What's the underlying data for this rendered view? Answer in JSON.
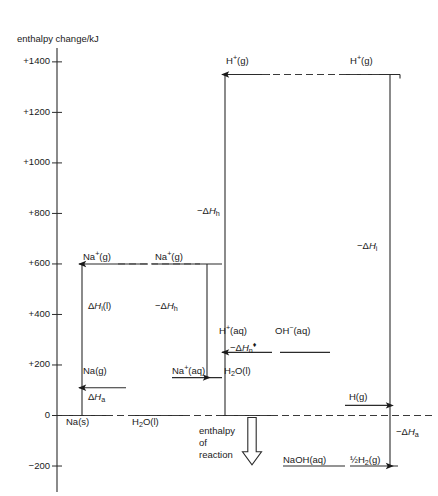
{
  "axis": {
    "title": "enthalpy change/kJ",
    "ticks": [
      "+1400",
      "+1200",
      "+1000",
      "+800",
      "+600",
      "+400",
      "+200",
      "0",
      "−200"
    ],
    "values": [
      1400,
      1200,
      1000,
      800,
      600,
      400,
      200,
      0,
      -200
    ]
  },
  "levels": {
    "na_plus_g_left": {
      "label_html": "Na<sup>+</sup>(g)",
      "value": 600
    },
    "na_plus_g_right": {
      "label_html": "Na<sup>+</sup>(g)",
      "value": 600
    },
    "na_g": {
      "label_html": "Na(g)",
      "value": 110
    },
    "na_s": {
      "label_html": "Na(s)",
      "value": 0
    },
    "h2o_l_left": {
      "label_html": "H<sub>2</sub>O(l)",
      "value": 0
    },
    "na_plus_aq": {
      "label_html": "Na<sup>+</sup>(aq)",
      "value": 150
    },
    "h_plus_g_left": {
      "label_html": "H<sup>+</sup>(g)",
      "value": 1350
    },
    "h_plus_g_right": {
      "label_html": "H<sup>+</sup>(g)",
      "value": 1350
    },
    "h_plus_aq": {
      "label_html": "H<sup>+</sup>(aq)",
      "value": 250
    },
    "oh_minus_aq": {
      "label_html": "OH<sup>−</sup>(aq)",
      "value": 250
    },
    "h2o_l_mid": {
      "label_html": "H<sub>2</sub>O(l)",
      "value": 0
    },
    "h_g": {
      "label_html": "H(g)",
      "value": 40
    },
    "naoh_aq": {
      "label_html": "NaOH(aq)",
      "value": -200
    },
    "half_h2_g": {
      "label_html": "½H<sub>2</sub>(g)",
      "value": -200
    }
  },
  "arrows": {
    "atomisation_na": {
      "label_html": "Δ<i>H</i><sub>a</sub>",
      "from": 0,
      "to": 110,
      "dir": "up"
    },
    "ionisation_na": {
      "label_html": "Δ<i>H</i><sub>i</sub>(l)",
      "from": 110,
      "to": 600,
      "dir": "up"
    },
    "hydration_na": {
      "label_html": "−Δ<i>H</i><sub>h</sub>",
      "from": 600,
      "to": 150,
      "dir": "down"
    },
    "hydration_h": {
      "label_html": "−Δ<i>H</i><sub>h</sub>",
      "from": 250,
      "to": 1350,
      "dir": "up"
    },
    "neutralisation": {
      "label_html": "−Δ<i>H</i><sub>n</sub><sup>♦</sup>",
      "from": 0,
      "to": 250,
      "dir": "up"
    },
    "ionisation_h": {
      "label_html": "−Δ<i>H</i><sub>i</sub>",
      "from": 1350,
      "to": 40,
      "dir": "down"
    },
    "atomisation_h": {
      "label_html": "−Δ<i>H</i><sub>a</sub>",
      "from": 40,
      "to": -200,
      "dir": "down"
    },
    "reaction": {
      "label_lines": [
        "enthalpy",
        "of",
        "reaction"
      ],
      "from": 0,
      "to": -195,
      "dir": "down"
    }
  },
  "colors": {
    "ink": "#1a1a1a",
    "line": "#2b2b2b",
    "dashed": "#3a3a3a",
    "background": "#ffffff"
  }
}
